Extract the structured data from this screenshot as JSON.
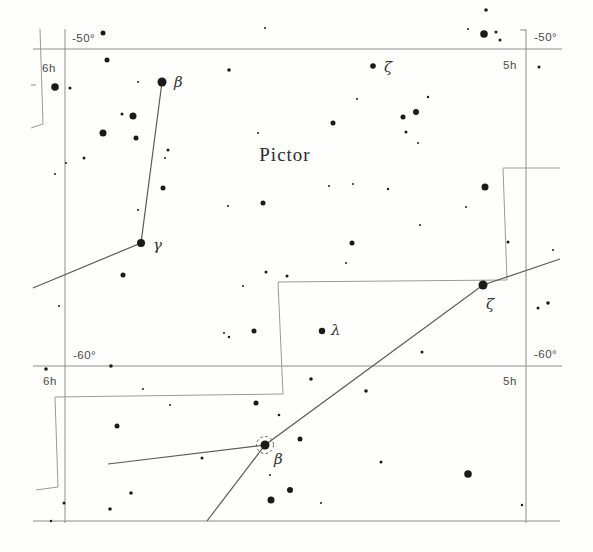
{
  "chart_data": {
    "type": "scatter",
    "chart_kind": "star-map",
    "constellation": "Pictor",
    "width": 593,
    "height": 552,
    "colors": {
      "bg": "#fefefd",
      "star": "#1a1a1a",
      "grid": "#8d8d8d",
      "boundary": "#9a9a9a",
      "line": "#5a5a5a",
      "text": "#4a4a4a",
      "title": "#2b2b2b"
    },
    "title_label": {
      "text": "Pictor",
      "x": 285,
      "y": 161
    },
    "axis_labels": [
      {
        "text": "-50°",
        "x": 72,
        "y": 42
      },
      {
        "text": "-50°",
        "x": 534,
        "y": 41
      },
      {
        "text": "6h",
        "x": 42,
        "y": 72
      },
      {
        "text": "5h",
        "x": 503,
        "y": 69
      },
      {
        "text": "-60°",
        "x": 73,
        "y": 359
      },
      {
        "text": "-60°",
        "x": 534,
        "y": 358
      },
      {
        "text": "6h",
        "x": 43,
        "y": 385
      },
      {
        "text": "5h",
        "x": 503,
        "y": 385
      }
    ],
    "grid_lines": [
      {
        "name": "declination-line--50",
        "x1": 33,
        "y1": 49,
        "x2": 562,
        "y2": 49
      },
      {
        "name": "declination-line--60",
        "x1": 33,
        "y1": 366,
        "x2": 562,
        "y2": 366
      },
      {
        "name": "declination-line-bottom",
        "x1": 33,
        "y1": 521,
        "x2": 560,
        "y2": 521
      },
      {
        "name": "ra-line-6h",
        "x1": 65,
        "y1": 29,
        "x2": 65,
        "y2": 523
      },
      {
        "name": "ra-line-5h",
        "x1": 526,
        "y1": 29,
        "x2": 526,
        "y2": 523
      },
      {
        "name": "ra-5h-top-tick",
        "x1": 520,
        "y1": 30,
        "x2": 526,
        "y2": 30
      },
      {
        "name": "left-edge-tick",
        "x1": 31,
        "y1": 85,
        "x2": 36,
        "y2": 85
      }
    ],
    "boundary_polylines": [
      [
        [
          40,
          29
        ],
        [
          43,
          124
        ],
        [
          31,
          128
        ]
      ],
      [
        [
          560,
          168
        ],
        [
          503,
          168
        ],
        [
          507,
          280
        ],
        [
          278,
          282
        ],
        [
          283,
          394
        ],
        [
          55,
          397
        ],
        [
          58,
          487
        ],
        [
          36,
          490
        ]
      ]
    ],
    "constellation_lines": [
      [
        [
          162,
          82
        ],
        [
          141,
          243
        ],
        [
          33,
          288
        ]
      ],
      [
        [
          108,
          464
        ],
        [
          265,
          445
        ]
      ],
      [
        [
          207,
          521
        ],
        [
          265,
          445
        ],
        [
          483,
          285
        ],
        [
          560,
          259
        ]
      ]
    ],
    "named_stars": [
      {
        "label": "β",
        "x": 162,
        "y": 82,
        "r": 4.5,
        "lx": 174,
        "ly": 87
      },
      {
        "label": "γ",
        "x": 141,
        "y": 243,
        "r": 4.0,
        "lx": 153,
        "ly": 250
      },
      {
        "label": "ζ",
        "x": 373,
        "y": 66,
        "r": 2.8,
        "lx": 384,
        "ly": 72
      },
      {
        "label": "ζ",
        "x": 483,
        "y": 285,
        "r": 4.5,
        "lx": 486,
        "ly": 309
      },
      {
        "label": "λ",
        "x": 322,
        "y": 331,
        "r": 3.2,
        "lx": 331,
        "ly": 335
      }
    ],
    "circled_star": {
      "label": "β",
      "x": 265,
      "y": 445,
      "r": 4.5,
      "ring_r": 8.5,
      "lx": 274,
      "ly": 464
    },
    "stars": [
      {
        "x": 265,
        "y": 28,
        "r": 1.0
      },
      {
        "x": 103,
        "y": 33,
        "r": 2.5
      },
      {
        "x": 486,
        "y": 10,
        "r": 1.8
      },
      {
        "x": 484,
        "y": 34,
        "r": 3.8
      },
      {
        "x": 496,
        "y": 32,
        "r": 1.5
      },
      {
        "x": 500,
        "y": 40,
        "r": 1.5
      },
      {
        "x": 468,
        "y": 29,
        "r": 1.0
      },
      {
        "x": 107,
        "y": 60,
        "r": 2.5
      },
      {
        "x": 229,
        "y": 70,
        "r": 1.8
      },
      {
        "x": 539,
        "y": 67,
        "r": 1.5
      },
      {
        "x": 55,
        "y": 87,
        "r": 3.8
      },
      {
        "x": 70,
        "y": 88,
        "r": 1.5
      },
      {
        "x": 138,
        "y": 82,
        "r": 1.0
      },
      {
        "x": 357,
        "y": 99,
        "r": 1.0
      },
      {
        "x": 428,
        "y": 97,
        "r": 1.2
      },
      {
        "x": 122,
        "y": 114,
        "r": 1.5
      },
      {
        "x": 133,
        "y": 116,
        "r": 3.5
      },
      {
        "x": 416,
        "y": 112,
        "r": 3.0
      },
      {
        "x": 403,
        "y": 117,
        "r": 2.5
      },
      {
        "x": 333,
        "y": 123,
        "r": 2.5
      },
      {
        "x": 103,
        "y": 133,
        "r": 3.5
      },
      {
        "x": 136,
        "y": 138,
        "r": 2.5
      },
      {
        "x": 406,
        "y": 132,
        "r": 1.5
      },
      {
        "x": 258,
        "y": 133,
        "r": 1.0
      },
      {
        "x": 418,
        "y": 143,
        "r": 1.0
      },
      {
        "x": 168,
        "y": 150,
        "r": 1.5
      },
      {
        "x": 165,
        "y": 158,
        "r": 1.0
      },
      {
        "x": 84,
        "y": 158,
        "r": 1.5
      },
      {
        "x": 66,
        "y": 163,
        "r": 1.0
      },
      {
        "x": 55,
        "y": 174,
        "r": 1.0
      },
      {
        "x": 163,
        "y": 188,
        "r": 2.5
      },
      {
        "x": 485,
        "y": 187,
        "r": 3.5
      },
      {
        "x": 228,
        "y": 206,
        "r": 1.0
      },
      {
        "x": 263,
        "y": 203,
        "r": 2.5
      },
      {
        "x": 329,
        "y": 186,
        "r": 1.0
      },
      {
        "x": 353,
        "y": 184,
        "r": 1.0
      },
      {
        "x": 388,
        "y": 189,
        "r": 1.2
      },
      {
        "x": 466,
        "y": 207,
        "r": 1.0
      },
      {
        "x": 138,
        "y": 210,
        "r": 1.0
      },
      {
        "x": 352,
        "y": 243,
        "r": 2.5
      },
      {
        "x": 346,
        "y": 263,
        "r": 1.0
      },
      {
        "x": 266,
        "y": 272,
        "r": 1.5
      },
      {
        "x": 287,
        "y": 276,
        "r": 1.5
      },
      {
        "x": 243,
        "y": 286,
        "r": 1.0
      },
      {
        "x": 123,
        "y": 275,
        "r": 2.5
      },
      {
        "x": 59,
        "y": 306,
        "r": 1.0
      },
      {
        "x": 508,
        "y": 242,
        "r": 1.5
      },
      {
        "x": 553,
        "y": 250,
        "r": 1.0
      },
      {
        "x": 420,
        "y": 225,
        "r": 1.0
      },
      {
        "x": 538,
        "y": 308,
        "r": 1.5
      },
      {
        "x": 548,
        "y": 303,
        "r": 1.8
      },
      {
        "x": 254,
        "y": 331,
        "r": 2.5
      },
      {
        "x": 224,
        "y": 333,
        "r": 1.0
      },
      {
        "x": 229,
        "y": 337,
        "r": 1.2
      },
      {
        "x": 422,
        "y": 352,
        "r": 1.5
      },
      {
        "x": 46,
        "y": 369,
        "r": 1.8
      },
      {
        "x": 111,
        "y": 366,
        "r": 1.8
      },
      {
        "x": 143,
        "y": 389,
        "r": 1.0
      },
      {
        "x": 170,
        "y": 405,
        "r": 1.0
      },
      {
        "x": 117,
        "y": 426,
        "r": 2.5
      },
      {
        "x": 256,
        "y": 403,
        "r": 2.5
      },
      {
        "x": 311,
        "y": 379,
        "r": 1.8
      },
      {
        "x": 366,
        "y": 391,
        "r": 1.8
      },
      {
        "x": 279,
        "y": 415,
        "r": 1.3
      },
      {
        "x": 300,
        "y": 439,
        "r": 2.5
      },
      {
        "x": 202,
        "y": 458,
        "r": 1.5
      },
      {
        "x": 270,
        "y": 475,
        "r": 1.0
      },
      {
        "x": 271,
        "y": 500,
        "r": 3.5
      },
      {
        "x": 290,
        "y": 490,
        "r": 3.0
      },
      {
        "x": 321,
        "y": 503,
        "r": 1.0
      },
      {
        "x": 381,
        "y": 462,
        "r": 1.5
      },
      {
        "x": 468,
        "y": 474,
        "r": 3.8
      },
      {
        "x": 522,
        "y": 505,
        "r": 1.2
      },
      {
        "x": 64,
        "y": 503,
        "r": 1.5
      },
      {
        "x": 110,
        "y": 509,
        "r": 1.8
      },
      {
        "x": 131,
        "y": 493,
        "r": 1.8
      },
      {
        "x": 51,
        "y": 521,
        "r": 1.2
      }
    ]
  }
}
